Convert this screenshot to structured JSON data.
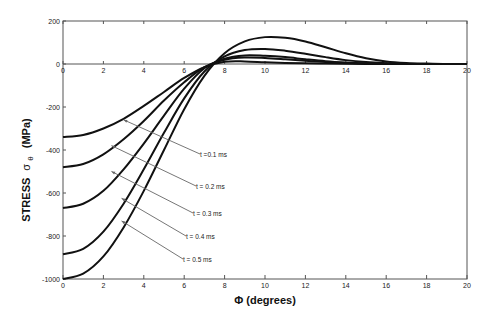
{
  "chart_data": {
    "type": "line",
    "title": "",
    "xlabel": "Φ (degrees)",
    "ylabel": "STRESS σθ (MPa)",
    "ylabel_parts": {
      "main": "STRESS",
      "symbol": "σ",
      "subscript": "θ",
      "unit": "(MPa)"
    },
    "xlim": [
      0,
      20
    ],
    "ylim": [
      -1000,
      200
    ],
    "x_ticks": [
      0,
      2,
      4,
      6,
      8,
      10,
      12,
      14,
      16,
      18,
      20
    ],
    "y_ticks": [
      200,
      0,
      -200,
      -400,
      -600,
      -800,
      -1000
    ],
    "grid": false,
    "legend": "annotations with arrows",
    "x": [
      0,
      1,
      2,
      3,
      4,
      5,
      6,
      7,
      8,
      9,
      10,
      11,
      12,
      13,
      14,
      15,
      16,
      17,
      18,
      19,
      20
    ],
    "series": [
      {
        "name": "t = 0.1 ms",
        "values": [
          -340,
          -330,
          -300,
          -255,
          -195,
          -130,
          -65,
          -15,
          10,
          12,
          8,
          5,
          3,
          2,
          1,
          0,
          0,
          0,
          0,
          0,
          0
        ]
      },
      {
        "name": "t = 0.2 ms",
        "values": [
          -480,
          -465,
          -420,
          -350,
          -265,
          -170,
          -85,
          -15,
          20,
          30,
          28,
          22,
          15,
          9,
          5,
          2,
          1,
          0,
          0,
          0,
          0
        ]
      },
      {
        "name": "t = 0.3 ms",
        "values": [
          -670,
          -650,
          -590,
          -490,
          -370,
          -240,
          -115,
          -20,
          25,
          40,
          38,
          32,
          22,
          13,
          7,
          3,
          1,
          0,
          0,
          0,
          0
        ]
      },
      {
        "name": "t = 0.4 ms",
        "values": [
          -885,
          -860,
          -780,
          -650,
          -490,
          -320,
          -160,
          -35,
          35,
          65,
          70,
          62,
          48,
          32,
          18,
          9,
          4,
          1,
          0,
          0,
          0
        ]
      },
      {
        "name": "t = 0.5 ms",
        "values": [
          -1000,
          -975,
          -895,
          -760,
          -590,
          -400,
          -210,
          -55,
          50,
          105,
          125,
          122,
          105,
          78,
          50,
          27,
          12,
          5,
          2,
          0,
          0
        ]
      }
    ]
  },
  "annotations": [
    {
      "label": "t =0.1 ms",
      "at_x": 2.9,
      "at_y": -255
    },
    {
      "label": "t = 0.2 ms",
      "at_x": 2.3,
      "at_y": -375
    },
    {
      "label": "t = 0.3 ms",
      "at_x": 2.3,
      "at_y": -495
    },
    {
      "label": "t = 0.4 ms",
      "at_x": 2.8,
      "at_y": -620
    },
    {
      "label": "t = 0.5 ms",
      "at_x": 2.8,
      "at_y": -725
    }
  ],
  "style": {
    "line_color": "#111111",
    "axis_color": "#555555",
    "arrow_color": "#666666"
  }
}
